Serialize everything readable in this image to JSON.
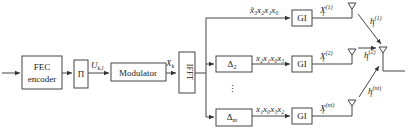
{
  "diagram": {
    "blocks": {
      "fec": [
        "FEC",
        "encoder"
      ],
      "interleaver": "Π",
      "modulator": "Modulator",
      "ifft": "IFFT",
      "delay2": {
        "main": "Δ",
        "sub": "2"
      },
      "delayn": {
        "main": "Δ",
        "sub": "nt"
      },
      "gi": "GI"
    },
    "signals": {
      "u": {
        "main": "U",
        "sub": "k,l"
      },
      "x": {
        "main": "X",
        "sub": "k"
      },
      "branch1": "x̃₃x₂x₁x₀",
      "branch2": "x₂x₁x₀x₃",
      "branch3": "x₁x₀x₃x₂",
      "out1": {
        "main": "X",
        "sub": "t",
        "sup": "(1)"
      },
      "out2": {
        "main": "X",
        "sub": "t",
        "sup": "(2)"
      },
      "out3": {
        "main": "X",
        "sub": "t",
        "sup": "(nt)"
      },
      "h1": {
        "main": "h",
        "sub": "t",
        "sup": "(1)"
      },
      "h2": {
        "main": "h",
        "sub": "t",
        "sup": "(2)"
      },
      "h3": {
        "main": "h",
        "sub": "t",
        "sup": "(nt)"
      },
      "ellipsis": "⋮"
    }
  }
}
